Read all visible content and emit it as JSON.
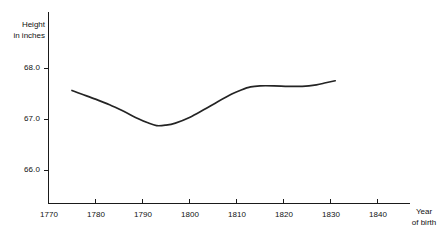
{
  "chart_data": {
    "type": "line",
    "title": "",
    "subtitle": "",
    "xlabel": "Year of birth",
    "ylabel": "Height in inches",
    "ylabel_line1": "Height",
    "ylabel_line2": "in inches",
    "xlabel_line1": "Year",
    "xlabel_line2": "of birth",
    "grid": false,
    "legend": false,
    "legend_position": "none",
    "line_color": "#242424",
    "axis_color": "#1a1a1a",
    "background_color": "#ffffff",
    "xlim": [
      1770,
      1845
    ],
    "ylim": [
      65.55,
      68.35
    ],
    "xticks": [
      1770,
      1780,
      1790,
      1800,
      1810,
      1820,
      1830,
      1840
    ],
    "xtick_labels": [
      "1770",
      "1780",
      "1790",
      "1800",
      "1810",
      "1820",
      "1830",
      "1840"
    ],
    "yticks": [
      66.0,
      67.0,
      68.0
    ],
    "ytick_labels": [
      "66.0",
      "67.0",
      "68.0"
    ],
    "series": [
      {
        "name": "Mean height by year of birth",
        "x": [
          1775,
          1777,
          1780,
          1783,
          1786,
          1789,
          1791,
          1793,
          1795,
          1797,
          1800,
          1803,
          1806,
          1809,
          1811,
          1813,
          1815,
          1818,
          1821,
          1824,
          1827,
          1829,
          1831
        ],
        "values": [
          67.57,
          67.5,
          67.4,
          67.29,
          67.16,
          67.02,
          66.94,
          66.88,
          66.89,
          66.93,
          67.04,
          67.19,
          67.35,
          67.5,
          67.58,
          67.64,
          67.66,
          67.66,
          67.65,
          67.65,
          67.68,
          67.72,
          67.76
        ]
      }
    ],
    "annotations": []
  }
}
